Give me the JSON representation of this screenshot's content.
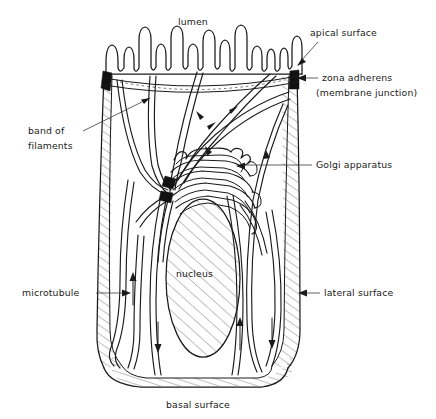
{
  "figure": {
    "background_color": "#ffffff",
    "ink_color": "#1a1a1a",
    "width": 436,
    "height": 419
  },
  "labels": {
    "lumen": "lumen",
    "apical_surface": "apical surface",
    "zona_adherens": "zona adherens",
    "zona_adherens_sub": "(membrane junction)",
    "band_of_filaments_line1": "band of",
    "band_of_filaments_line2": "filaments",
    "golgi_apparatus": "Golgi apparatus",
    "nucleus": "nucleus",
    "microtubule": "microtubule",
    "lateral_surface": "lateral surface",
    "basal_surface": "basal surface"
  },
  "structures": [
    {
      "name": "microvilli-brush-border",
      "label": "lumen"
    },
    {
      "name": "apical-surface",
      "label": "apical surface"
    },
    {
      "name": "zona-adherens",
      "label": "zona adherens"
    },
    {
      "name": "actin-filament-band",
      "label": "band of filaments"
    },
    {
      "name": "golgi-apparatus",
      "label": "Golgi apparatus"
    },
    {
      "name": "nucleus",
      "label": "nucleus"
    },
    {
      "name": "microtubule",
      "label": "microtubule"
    },
    {
      "name": "lateral-surface",
      "label": "lateral surface"
    },
    {
      "name": "basal-surface",
      "label": "basal surface"
    }
  ]
}
